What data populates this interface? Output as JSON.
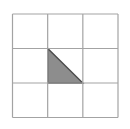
{
  "figure": {
    "canvas": {
      "width": 130,
      "height": 129,
      "background": "#ffffff"
    },
    "grid": {
      "rows": 3,
      "cols": 3,
      "x": 12.5,
      "y": 14,
      "width": 105.5,
      "height": 103.5,
      "line_color": "#a3a3a3",
      "line_width": 1.2,
      "cell_fill": "#ffffff"
    },
    "triangle": {
      "vertices": [
        [
          47.7,
          48.5
        ],
        [
          47.7,
          83.0
        ],
        [
          82.8,
          83.0
        ]
      ],
      "fill": "#8d8d8d",
      "stroke": "#4c4c4c",
      "stroke_width": 1.4
    }
  }
}
